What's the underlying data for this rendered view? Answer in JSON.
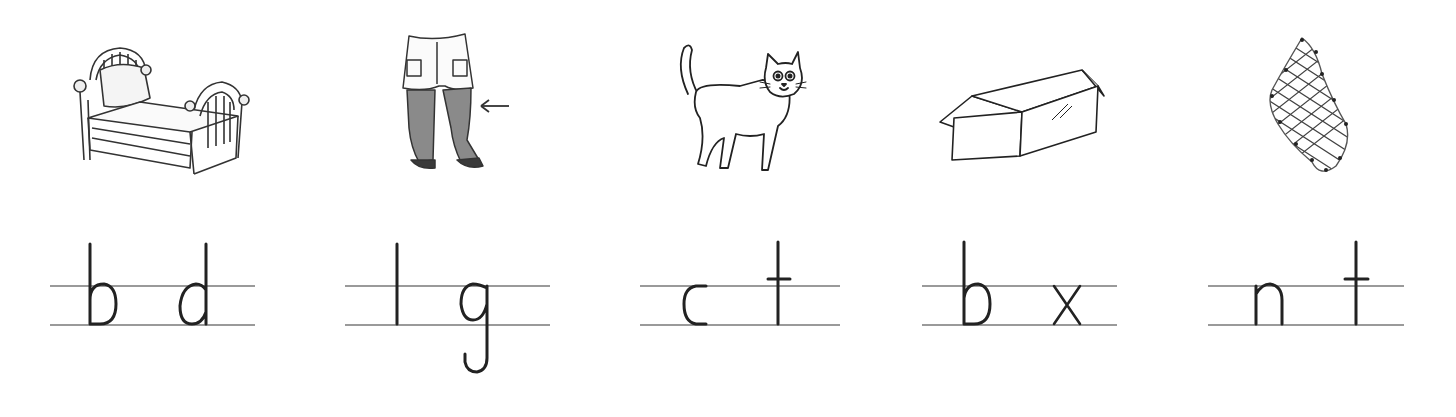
{
  "worksheet": {
    "items": [
      {
        "picture": "bed",
        "letters": [
          "b",
          "d"
        ],
        "picture_label": "bed"
      },
      {
        "picture": "legs-in-tights",
        "letters": [
          "l",
          "g"
        ],
        "picture_label": "legs with tights, arrow pointing at leg"
      },
      {
        "picture": "cat",
        "letters": [
          "c",
          "t"
        ],
        "picture_label": "cat"
      },
      {
        "picture": "box",
        "letters": [
          "b",
          "x"
        ],
        "picture_label": "box"
      },
      {
        "picture": "net",
        "letters": [
          "n",
          "t"
        ],
        "picture_label": "net"
      }
    ]
  },
  "colors": {
    "ink": "#222222",
    "rule": "#9a9a9a",
    "background": "#ffffff"
  }
}
